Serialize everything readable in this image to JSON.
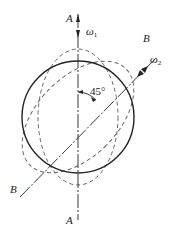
{
  "diagram": {
    "axis_a": {
      "label_top": "A",
      "label_bottom": "A",
      "angular_velocity": "ω",
      "angular_velocity_sub": "1"
    },
    "axis_b": {
      "label_top": "B",
      "label_bottom": "B",
      "angular_velocity": "ω",
      "angular_velocity_sub": "2"
    },
    "angle_label": "45°",
    "colors": {
      "solid": "#222222",
      "dashed": "#666666"
    }
  }
}
